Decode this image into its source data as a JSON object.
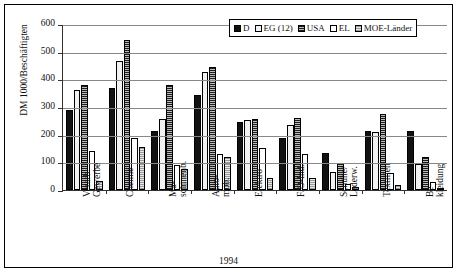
{
  "chart_data": {
    "type": "bar",
    "title": "",
    "xlabel": "1994",
    "ylabel": "DM 1000/Beschäftigten",
    "ylim": [
      0,
      600
    ],
    "yticks": [
      0,
      100,
      200,
      300,
      400,
      500,
      600
    ],
    "grid": true,
    "legend_position": "top-right",
    "categories": [
      "Verarb. Gewerbe",
      "Chemie",
      "Ma- schinenb.",
      "Auto- mob.",
      "Elektro",
      "F/O-Ind.",
      "Schuhe/ Lederw.",
      "Textilien",
      "Be- kleidung"
    ],
    "category_lines": [
      [
        "Verarb.",
        "Gewerbe"
      ],
      [
        "Chemie",
        ""
      ],
      [
        "Ma-",
        "schinenb."
      ],
      [
        "Auto-",
        "mob."
      ],
      [
        "Elektro",
        ""
      ],
      [
        "F/O-Ind.",
        ""
      ],
      [
        "Schuhe/",
        "Lederw."
      ],
      [
        "Textilien",
        ""
      ],
      [
        "Be-",
        "kleidung"
      ]
    ],
    "series": [
      {
        "name": "D",
        "key": "d",
        "color": "#111111",
        "values": [
          290,
          370,
          215,
          342,
          245,
          188,
          135,
          215,
          215
        ]
      },
      {
        "name": "EG (12)",
        "key": "eg",
        "color": "#f2f2f2",
        "values": [
          363,
          465,
          258,
          425,
          252,
          235,
          65,
          208,
          95
        ]
      },
      {
        "name": "USA",
        "key": "usa",
        "color": "#6e6e6e",
        "values": [
          380,
          542,
          378,
          445,
          258,
          262,
          98,
          275,
          120
        ]
      },
      {
        "name": "EL",
        "key": "el",
        "color": "#ffffff",
        "values": [
          140,
          188,
          90,
          130,
          152,
          130,
          22,
          62,
          28
        ]
      },
      {
        "name": "MOE-Länder",
        "key": "moe",
        "color": "#cfcfcf",
        "values": [
          32,
          155,
          75,
          118,
          45,
          42,
          12,
          18,
          8
        ]
      }
    ]
  },
  "legend": {
    "items": [
      {
        "label": "D"
      },
      {
        "label": "EG (12)"
      },
      {
        "label": "USA"
      },
      {
        "label": "EL"
      },
      {
        "label": "MOE-Länder"
      }
    ]
  }
}
